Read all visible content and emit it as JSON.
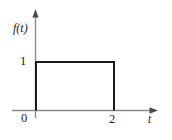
{
  "figure": {
    "kind": "line-plot",
    "background_color": "#ffffff",
    "axis_color": "#8a8a8a",
    "curve_color": "#1b1b1b",
    "text_color": "#1b1b1b"
  },
  "labels": {
    "y_axis": "f(t)",
    "x_axis": "t",
    "origin": "0",
    "y_tick_one": "1",
    "x_tick_two": "2"
  },
  "icons": {
    "y_axis_arrow": "arrow-up-icon",
    "x_axis_arrow": "arrow-right-icon"
  },
  "chart_data": {
    "type": "line",
    "title": "",
    "xlabel": "t",
    "ylabel": "f(t)",
    "xlim": [
      -0.35,
      3.1
    ],
    "ylim": [
      -0.25,
      1.55
    ],
    "grid": false,
    "legend": null,
    "xticks": [
      0,
      2
    ],
    "xticklabels": [
      "0",
      "2"
    ],
    "yticks": [
      1
    ],
    "yticklabels": [
      "1"
    ],
    "annotations": [],
    "series": [
      {
        "name": "f(t)",
        "description": "Rectangular pulse of amplitude 1 on the interval 0 < t < 2, zero elsewhere",
        "color": "#1b1b1b",
        "linewidth": 2,
        "x": [
          0,
          0,
          2,
          2
        ],
        "y": [
          0,
          1,
          1,
          0
        ]
      }
    ]
  }
}
